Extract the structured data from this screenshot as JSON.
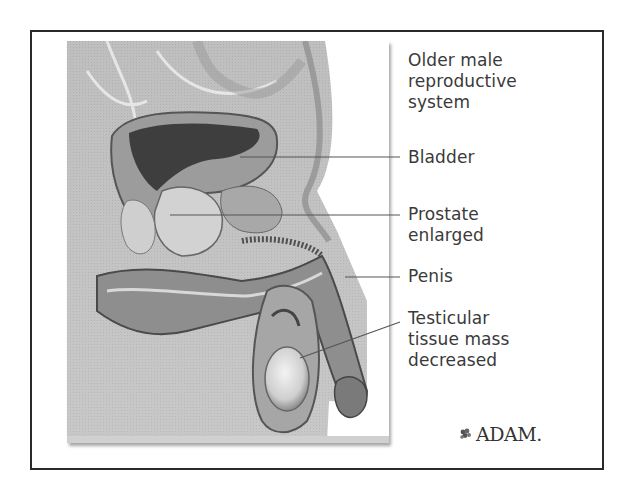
{
  "figure": {
    "title": "Older male reproductive system",
    "title_lines": "Older male\nreproductive\nsystem",
    "labels": [
      {
        "id": "bladder",
        "text": "Bladder"
      },
      {
        "id": "prostate",
        "text": "Prostate\nenlarged"
      },
      {
        "id": "penis",
        "text": "Penis"
      },
      {
        "id": "testicular",
        "text": "Testicular\ntissue mass\ndecreased"
      }
    ],
    "logo": {
      "icon": "grape-leaf-icon",
      "text": "ADAM."
    },
    "colors": {
      "frame": "#2a2a2a",
      "text": "#3a3a3a",
      "leader_line": "#555555",
      "illustration_base": "#bdbdbd"
    }
  }
}
